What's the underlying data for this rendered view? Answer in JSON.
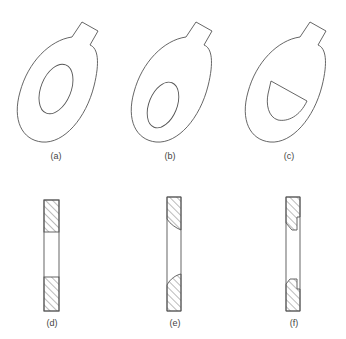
{
  "figure": {
    "panels": [
      {
        "id": "a",
        "label": "(a)",
        "kind": "plan-view",
        "hole": "centered elliptical hole"
      },
      {
        "id": "b",
        "label": "(b)",
        "kind": "plan-view",
        "hole": "offset elliptical hole"
      },
      {
        "id": "c",
        "label": "(c)",
        "kind": "plan-view",
        "hole": "D-shaped (half-ellipse) hole"
      },
      {
        "id": "d",
        "label": "(d)",
        "kind": "cross-section",
        "edge": "square edges"
      },
      {
        "id": "e",
        "label": "(e)",
        "kind": "cross-section",
        "edge": "rounded (curved) edges"
      },
      {
        "id": "f",
        "label": "(f)",
        "kind": "cross-section",
        "edge": "stepped/notched edges"
      }
    ],
    "colors": {
      "line": "#555555",
      "background": "#ffffff"
    }
  }
}
